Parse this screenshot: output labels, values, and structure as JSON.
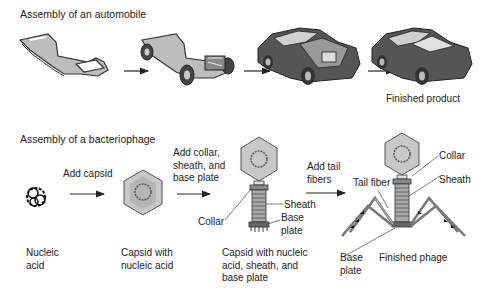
{
  "automobile": {
    "title": "Assembly of an automobile",
    "stages": [
      {
        "name": "chassis-frame"
      },
      {
        "name": "chassis-with-wheels-and-engine"
      },
      {
        "name": "car-body-with-open-hood"
      },
      {
        "name": "finished-car",
        "label": "Finished product"
      }
    ]
  },
  "bacteriophage": {
    "title": "Assembly of a bacteriophage",
    "steps": [
      {
        "label": "Add capsid"
      },
      {
        "label": "Add collar,\nsheath, and\nbase plate"
      },
      {
        "label": "Add tail\nfibers"
      }
    ],
    "stages": [
      {
        "label": "Nucleic\nacid"
      },
      {
        "label": "Capsid with\nnucleic acid"
      },
      {
        "label": "Capsid with nucleic\nacid, sheath, and\nbase plate",
        "parts": {
          "collar": "Collar",
          "sheath": "Sheath",
          "base_plate": "Base\nplate"
        }
      },
      {
        "label": "Finished phage",
        "parts": {
          "collar": "Collar",
          "sheath": "Sheath",
          "tail_fiber": "Tail fiber",
          "base_plate": "Base\nplate"
        }
      }
    ]
  },
  "colors": {
    "outline": "#333333",
    "fill_gray": "#bdbdbd",
    "car_body": "#555555",
    "glass": "#d0d0d0"
  }
}
